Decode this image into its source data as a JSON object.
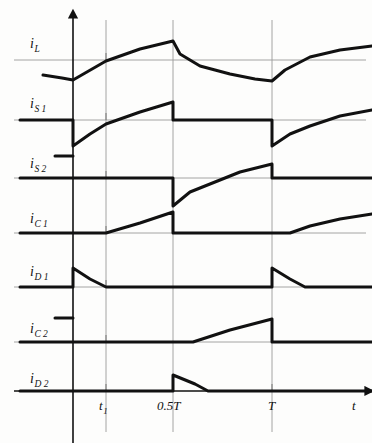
{
  "figure": {
    "type": "waveform-timing-diagram",
    "title": "",
    "background_color": "#fdfdfc",
    "trace_color": "#111111",
    "axis_color": "#8a8a8a",
    "width": 372,
    "height": 443
  },
  "axes": {
    "x_axis_label": "t",
    "y_axis_label": "",
    "x_axis_y": 391,
    "y_axis_x": 73,
    "x_ticks": [
      {
        "label": "t",
        "sub": "1",
        "x": 106
      },
      {
        "label": "0.5T",
        "sub": "",
        "x": 173
      },
      {
        "label": "T",
        "sub": "",
        "x": 272
      }
    ],
    "gridlines_x": [
      106,
      173,
      272
    ],
    "t_end": 372
  },
  "signals": [
    {
      "name": "i_L",
      "label": "i",
      "sub": "L",
      "label_x": 30,
      "label_y": 37,
      "baseline_y": 60,
      "description": "inductor current, continuous triangular ripple, peak at 0.5T, valley at 0 and T"
    },
    {
      "name": "i_S1",
      "label": "i",
      "sub": "S 1",
      "label_x": 30,
      "label_y": 97,
      "baseline_y": 120,
      "description": "switch S1 current, concave rise during 0 to 0.5T, zero during 0.5T to T"
    },
    {
      "name": "i_S2",
      "label": "i",
      "sub": "S 2",
      "label_x": 30,
      "label_y": 157,
      "baseline_y": 178,
      "description": "switch S2 current, zero during 0 to 0.5T, concave rise during 0.5T to T"
    },
    {
      "name": "i_C1",
      "label": "i",
      "sub": "C 1",
      "label_x": 30,
      "label_y": 212,
      "baseline_y": 233,
      "description": "capacitor C1 current, zero until t1, linear ramp up to 0.5T, then zero"
    },
    {
      "name": "i_D1",
      "label": "i",
      "sub": "D 1",
      "label_x": 30,
      "label_y": 265,
      "baseline_y": 287,
      "description": "diode D1 current, step up at t=0, decays to zero at t1, then zero"
    },
    {
      "name": "i_C2",
      "label": "i",
      "sub": "C 2",
      "label_x": 30,
      "label_y": 322,
      "baseline_y": 342,
      "description": "capacitor C2 current, zero until 0.5T+t1, linear ramp up to T, then zero"
    },
    {
      "name": "i_D2",
      "label": "i",
      "sub": "D 2",
      "label_x": 30,
      "label_y": 372,
      "baseline_y": 391,
      "description": "diode D2 current, step up at 0.5T, decays to zero at 0.5T+t1, then zero"
    }
  ],
  "chart_data": {
    "type": "line",
    "title": "",
    "xlabel": "t",
    "ylabel": "",
    "x_tick_labels": [
      "t1",
      "0.5T",
      "T"
    ],
    "x_tick_positions": [
      106,
      173,
      272
    ],
    "grid": true,
    "legend": "none",
    "series": [
      {
        "name": "i_L",
        "path": "M 43,75 L 62,78 L 73,80 L 106,61 L 140,49 L 173,41 L 180,54 L 200,66 L 230,74 L 255,79 L 272,81 L 285,70 L 310,57 L 340,50 L 372,46"
      },
      {
        "name": "i_S1",
        "path": "M 20,120 L 73,120 L 73,146 L 90,134 L 106,124 L 140,112 L 173,102 L 173,120 L 272,120 L 272,146 L 290,134 L 310,126 L 340,116 L 372,110"
      },
      {
        "name": "i_S2",
        "path": "M 55,156 L 73,156 M 20,178 L 173,178 L 173,206 L 190,192 L 210,184 L 240,172 L 272,164 L 272,178 L 372,178"
      },
      {
        "name": "i_C1",
        "path": "M 20,233 L 106,233 L 140,223 L 173,212 L 173,233 L 290,233 L 310,226 L 340,219 L 372,214"
      },
      {
        "name": "i_D1",
        "path": "M 20,287 L 73,287 L 73,268 L 90,279 L 106,287 L 272,287 L 272,268 L 290,279 L 305,287 L 372,287"
      },
      {
        "name": "i_C2",
        "path": "M 55,318 L 73,318 M 20,342 L 193,342 L 230,330 L 272,319 L 272,342 L 372,342"
      },
      {
        "name": "i_D2",
        "path": "M 20,391 L 173,391 L 173,375 L 195,384 L 208,391 L 372,391"
      }
    ]
  }
}
